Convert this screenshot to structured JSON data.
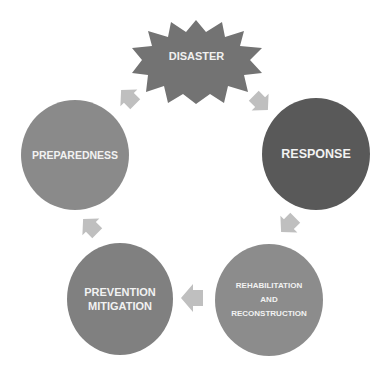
{
  "diagram": {
    "type": "cycle",
    "event": {
      "label": "DISASTER",
      "shape": "starburst",
      "color": "#737373"
    },
    "phases": [
      {
        "id": "response",
        "label": "RESPONSE",
        "color": "#595959"
      },
      {
        "id": "rehabilitation",
        "lines": [
          "REHABILITATION",
          "AND",
          "RECONSTRUCTION"
        ],
        "color": "#8c8c8c"
      },
      {
        "id": "prevention",
        "lines": [
          "PREVENTION",
          "MITIGATION"
        ],
        "color": "#808080"
      },
      {
        "id": "preparedness",
        "label": "PREPAREDNESS",
        "color": "#8a8a8a"
      }
    ],
    "arrow_color": "#bfbfbf",
    "flow": [
      "DISASTER",
      "RESPONSE",
      "REHABILITATION AND RECONSTRUCTION",
      "PREVENTION MITIGATION",
      "PREPAREDNESS",
      "DISASTER"
    ]
  }
}
